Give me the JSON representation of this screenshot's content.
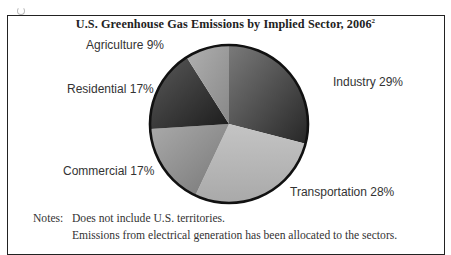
{
  "chart_data": {
    "type": "pie",
    "title": "U.S. Greenhouse Gas Emissions by Implied Sector, 2006",
    "title_footnote": "2",
    "start_angle_deg": 0,
    "direction": "clockwise",
    "slices": [
      {
        "label": "Industry",
        "value": 29,
        "display": "Industry 29%",
        "color": "#3a3a3a"
      },
      {
        "label": "Transportation",
        "value": 28,
        "display": "Transportation 28%",
        "color": "#b9b9b9"
      },
      {
        "label": "Commercial",
        "value": 17,
        "display": "Commercial 17%",
        "color": "#8e8e8e"
      },
      {
        "label": "Residential",
        "value": 17,
        "display": "Residential 17%",
        "color": "#2e2e2e"
      },
      {
        "label": "Agriculture",
        "value": 9,
        "display": "Agriculture 9%",
        "color": "#9c9c9c"
      }
    ],
    "units": "%",
    "legend": "none (direct labels)"
  },
  "notes": {
    "head": "Notes:",
    "lines": [
      "Does not include U.S. territories.",
      "Emissions from electrical generation has been allocated to the sectors."
    ]
  },
  "pie_geometry": {
    "cx": 229,
    "cy": 124,
    "r": 79
  }
}
